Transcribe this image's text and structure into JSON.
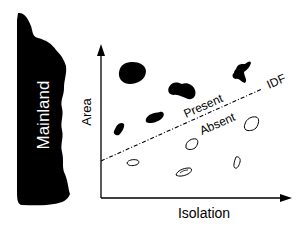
{
  "diagram": {
    "mainland_label": "Mainland",
    "y_axis_label": "Area",
    "x_axis_label": "Isolation",
    "line_label": "IDF",
    "above_label": "Present",
    "below_label": "Absent",
    "colors": {
      "ink": "#000000",
      "background": "#ffffff",
      "mainland_text": "#ffffff"
    },
    "islands_present": [
      {
        "id": "p1",
        "cx": 129,
        "cy": 74
      },
      {
        "id": "p2",
        "cx": 182,
        "cy": 91
      },
      {
        "id": "p3",
        "cx": 238,
        "cy": 73
      },
      {
        "id": "p4",
        "cx": 155,
        "cy": 117
      },
      {
        "id": "p5",
        "cx": 120,
        "cy": 130
      }
    ],
    "islands_absent": [
      {
        "id": "a1",
        "cx": 252,
        "cy": 125
      },
      {
        "id": "a2",
        "cx": 192,
        "cy": 144
      },
      {
        "id": "a3",
        "cx": 133,
        "cy": 162
      },
      {
        "id": "a4",
        "cx": 185,
        "cy": 172
      },
      {
        "id": "a5",
        "cx": 238,
        "cy": 163
      }
    ]
  }
}
